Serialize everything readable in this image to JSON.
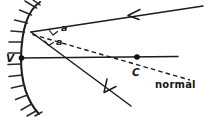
{
  "diagram": {
    "background_color": "#ffffff",
    "ink_color": "#1c1c1c",
    "labels": {
      "vertex": "V",
      "center": "C",
      "normal": "normal",
      "angle_incidence": "a",
      "angle_reflection": "a"
    },
    "elements": {
      "mirror_name": "concave mirror arc",
      "axis_name": "principal axis",
      "incident_ray_name": "incident ray",
      "reflected_ray_name": "reflected ray",
      "normal_line_name": "normal line through C"
    },
    "geometry": {
      "vertex_point": [
        21,
        58
      ],
      "center_point": [
        137,
        57
      ],
      "incidence_point": [
        31,
        32
      ],
      "incident_ray_start": [
        203,
        6
      ],
      "reflected_ray_end": [
        131,
        106
      ],
      "normal_end": [
        190,
        80
      ]
    }
  }
}
